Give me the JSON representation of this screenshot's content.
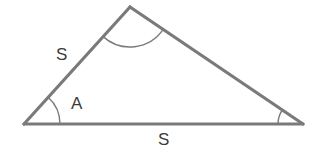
{
  "figure": {
    "name": "triangle-sas-diagram",
    "background_color": "#ffffff",
    "stroke_color": "#7a7a7a",
    "stroke_width": 3,
    "arc_color": "#7a7a7a",
    "arc_width": 1.4,
    "text_color": "#3b3b3b"
  },
  "labels": {
    "side_left": "S",
    "side_bottom": "S",
    "angle_included": "A"
  },
  "chart_data": {
    "type": "diagram",
    "shape": "triangle",
    "title": "",
    "vertices": [
      {
        "name": "left-vertex",
        "x": 24,
        "y": 124
      },
      {
        "name": "top-vertex",
        "x": 130,
        "y": 7
      },
      {
        "name": "right-vertex",
        "x": 303,
        "y": 124
      }
    ],
    "edges": [
      {
        "name": "left-side",
        "from": "left-vertex",
        "to": "top-vertex",
        "label": "S"
      },
      {
        "name": "right-side",
        "from": "top-vertex",
        "to": "right-vertex",
        "label": ""
      },
      {
        "name": "bottom-side",
        "from": "left-vertex",
        "to": "right-vertex",
        "label": "S"
      }
    ],
    "angle_marks": [
      {
        "name": "angle-left",
        "vertex": "left-vertex",
        "radius": 36,
        "label": "A"
      },
      {
        "name": "angle-top",
        "vertex": "top-vertex",
        "radius": 40,
        "label": ""
      },
      {
        "name": "angle-right",
        "vertex": "right-vertex",
        "radius": 25,
        "label": ""
      }
    ]
  }
}
